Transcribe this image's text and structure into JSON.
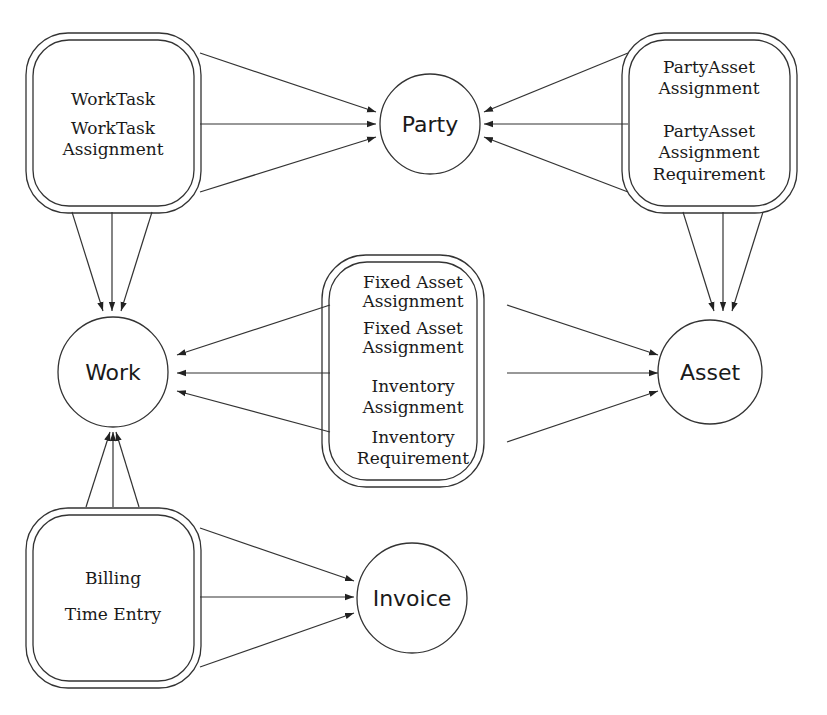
{
  "diagram": {
    "entities": [
      {
        "id": "party",
        "label": "Party",
        "shape": "circle"
      },
      {
        "id": "work",
        "label": "Work",
        "shape": "circle"
      },
      {
        "id": "asset",
        "label": "Asset",
        "shape": "circle"
      },
      {
        "id": "invoice",
        "label": "Invoice",
        "shape": "circle"
      }
    ],
    "relationships": [
      {
        "id": "worktask",
        "lines": [
          "WorkTask",
          "WorkTask",
          "Assignment"
        ],
        "shape": "double-rounded-rect"
      },
      {
        "id": "partyasset",
        "lines": [
          "PartyAsset",
          "Assignment",
          "PartyAsset",
          "Assignment",
          "Requirement"
        ],
        "shape": "double-rounded-rect"
      },
      {
        "id": "fixedasset",
        "lines": [
          "Fixed Asset",
          "Assignment",
          "Fixed Asset",
          "Assignment",
          "Inventory",
          "Assignment",
          "Inventory",
          "Requirement"
        ],
        "shape": "double-rounded-rect"
      },
      {
        "id": "billing",
        "lines": [
          "Billing",
          "Time Entry"
        ],
        "shape": "double-rounded-rect"
      }
    ],
    "edges": [
      {
        "from": "worktask",
        "to": "party",
        "count": 3
      },
      {
        "from": "worktask",
        "to": "work",
        "count": 3
      },
      {
        "from": "partyasset",
        "to": "party",
        "count": 3
      },
      {
        "from": "partyasset",
        "to": "asset",
        "count": 3
      },
      {
        "from": "fixedasset",
        "to": "work",
        "count": 3
      },
      {
        "from": "fixedasset",
        "to": "asset",
        "count": 3
      },
      {
        "from": "billing",
        "to": "work",
        "count": 3
      },
      {
        "from": "billing",
        "to": "invoice",
        "count": 3
      }
    ]
  }
}
